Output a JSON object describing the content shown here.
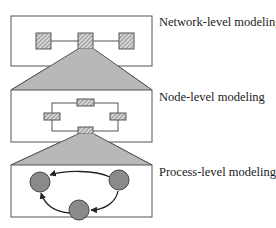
{
  "levels": [
    {
      "label": "Network-level modeling"
    },
    {
      "label": "Node-level modeling"
    },
    {
      "label": "Process-level modeling"
    }
  ],
  "colors": {
    "stroke": "#555555",
    "trapezoid": "#b8b8b8",
    "node_fill": "#8a8a8a",
    "hatch": "#cfcfcf"
  }
}
